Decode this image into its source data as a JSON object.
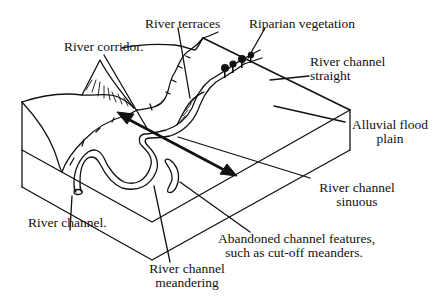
{
  "diagram": {
    "labels": {
      "river_corridor": "River corridor.",
      "river_terraces": "River terraces",
      "riparian_vegetation": "Riparian vegetation",
      "river_channel_straight_1": "River channel",
      "river_channel_straight_2": "straight",
      "alluvial_flood_plain_1": "Alluvial flood",
      "alluvial_flood_plain_2": "plain",
      "river_channel_sinuous_1": "River channel",
      "river_channel_sinuous_2": "sinuous",
      "abandoned_channel_1": "Abandoned channel features,",
      "abandoned_channel_2": "such as cut-off meanders.",
      "river_channel": "River channel.",
      "river_channel_meandering_1": "River channel",
      "river_channel_meandering_2": "meandering"
    },
    "colors": {
      "line": "#111111",
      "background": "#ffffff"
    }
  }
}
